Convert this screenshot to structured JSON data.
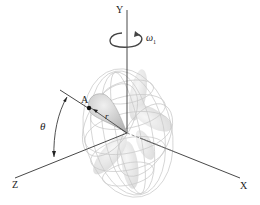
{
  "diagram": {
    "axes": {
      "y_label": "Y",
      "x_label": "X",
      "z_label": "Z"
    },
    "rotation": {
      "symbol": "ω",
      "subscript": "1",
      "label": "ω1"
    },
    "point": {
      "label": "A"
    },
    "radius": {
      "label": "r"
    },
    "angle": {
      "label": "θ"
    },
    "colors": {
      "axis": "#333333",
      "wireframe": "#c8c8c8",
      "lobe_fill": "#e6e6e6",
      "main_lobe_fill": "#d4d4d4",
      "point": "#111111"
    }
  }
}
